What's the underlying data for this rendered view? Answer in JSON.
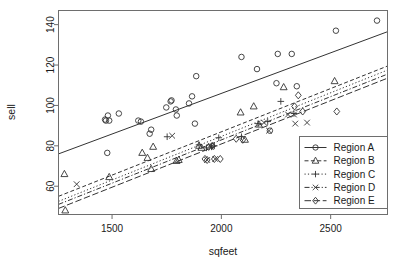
{
  "chart_data": {
    "type": "scatter",
    "title": "",
    "xlabel": "sqfeet",
    "ylabel": "sell",
    "xlim": [
      1255,
      2760
    ],
    "ylim": [
      46,
      147
    ],
    "xticks": [
      1500,
      2000,
      2500
    ],
    "yticks": [
      60,
      80,
      100,
      120,
      140
    ],
    "grid": false,
    "legend_position": "bottom-right",
    "legend_entries": [
      "Region A",
      "Region B",
      "Region C",
      "Region D",
      "Region E"
    ],
    "series": [
      {
        "name": "Region A",
        "marker": "circle",
        "linestyle": "solid",
        "points": [
          [
            1468,
            93
          ],
          [
            1472,
            92.5
          ],
          [
            1481,
            95
          ],
          [
            1487,
            92.5
          ],
          [
            1478,
            76.5
          ],
          [
            1531,
            96
          ],
          [
            1620,
            92.5
          ],
          [
            1632,
            92
          ],
          [
            1672,
            86
          ],
          [
            1679,
            88
          ],
          [
            1748,
            99
          ],
          [
            1768,
            102
          ],
          [
            1772,
            102.5
          ],
          [
            1792,
            98
          ],
          [
            1796,
            95
          ],
          [
            1852,
            101
          ],
          [
            1866,
            104.5
          ],
          [
            1879,
            91
          ],
          [
            1885,
            114.5
          ],
          [
            2092,
            124
          ],
          [
            2163,
            118
          ],
          [
            2222,
            87.5
          ],
          [
            2252,
            111
          ],
          [
            2258,
            125.5
          ],
          [
            2322,
            125.5
          ],
          [
            2345,
            109.5
          ],
          [
            2524,
            137
          ],
          [
            2712,
            142
          ]
        ],
        "fit": {
          "x1": 1255,
          "y1": 76,
          "x2": 2760,
          "y2": 136.5
        }
      },
      {
        "name": "Region B",
        "marker": "triangle",
        "linestyle": "dashed",
        "points": [
          [
            1282,
            66
          ],
          [
            1286,
            48
          ],
          [
            1487,
            64.5
          ],
          [
            1638,
            76.5
          ],
          [
            1662,
            74
          ],
          [
            1679,
            68.5
          ],
          [
            1688,
            79.5
          ],
          [
            1795,
            72.5
          ],
          [
            1805,
            73
          ],
          [
            1898,
            80
          ],
          [
            1909,
            79
          ],
          [
            2088,
            96.5
          ],
          [
            2108,
            83
          ],
          [
            2148,
            99.5
          ],
          [
            2172,
            90.5
          ],
          [
            2285,
            109
          ],
          [
            2518,
            112
          ]
        ],
        "fit": {
          "x1": 1255,
          "y1": 55,
          "x2": 2760,
          "y2": 119.5
        }
      },
      {
        "name": "Region C",
        "marker": "plus",
        "linestyle": "dotted",
        "points": [
          [
            1752,
            84.5
          ],
          [
            1898,
            80.5
          ],
          [
            1932,
            79
          ],
          [
            1955,
            79.5
          ],
          [
            1968,
            80
          ],
          [
            1988,
            84
          ],
          [
            2092,
            84.5
          ],
          [
            2168,
            91
          ],
          [
            2212,
            92
          ],
          [
            2272,
            102
          ],
          [
            2332,
            96
          ]
        ],
        "fit": {
          "x1": 1255,
          "y1": 52.5,
          "x2": 2760,
          "y2": 117.5
        }
      },
      {
        "name": "Region D",
        "marker": "cross",
        "linestyle": "dashdot",
        "points": [
          [
            1338,
            61
          ],
          [
            1775,
            85
          ],
          [
            1935,
            73
          ],
          [
            1952,
            79.5
          ],
          [
            1972,
            73.5
          ],
          [
            2195,
            91.5
          ],
          [
            2218,
            87.5
          ],
          [
            2305,
            95.5
          ],
          [
            2332,
            95.5
          ],
          [
            2338,
            91
          ],
          [
            2392,
            91.5
          ]
        ],
        "fit": {
          "x1": 1255,
          "y1": 51,
          "x2": 2760,
          "y2": 115.5
        }
      },
      {
        "name": "Region E",
        "marker": "diamond",
        "linestyle": "longdash",
        "points": [
          [
            1925,
            73.5
          ],
          [
            1935,
            73
          ],
          [
            1942,
            79.5
          ],
          [
            1958,
            80
          ],
          [
            1968,
            73.5
          ],
          [
            1995,
            73.5
          ],
          [
            2068,
            83.5
          ],
          [
            2098,
            83
          ],
          [
            2335,
            99.5
          ],
          [
            2352,
            105
          ],
          [
            2372,
            97
          ],
          [
            2528,
            97
          ]
        ],
        "fit": {
          "x1": 1255,
          "y1": 49,
          "x2": 2760,
          "y2": 113.5
        }
      }
    ]
  },
  "axes": {
    "xlabel": "sqfeet",
    "ylabel": "sell",
    "xtick_labels": [
      "1500",
      "2000",
      "2500"
    ],
    "ytick_labels": [
      "60",
      "80",
      "100",
      "120",
      "140"
    ]
  },
  "legend": {
    "items": [
      {
        "label": "Region A"
      },
      {
        "label": "Region B"
      },
      {
        "label": "Region C"
      },
      {
        "label": "Region D"
      },
      {
        "label": "Region E"
      }
    ]
  },
  "colors": {
    "ink": "#333333",
    "frame": "#6e6e6e",
    "background": "#ffffff"
  }
}
